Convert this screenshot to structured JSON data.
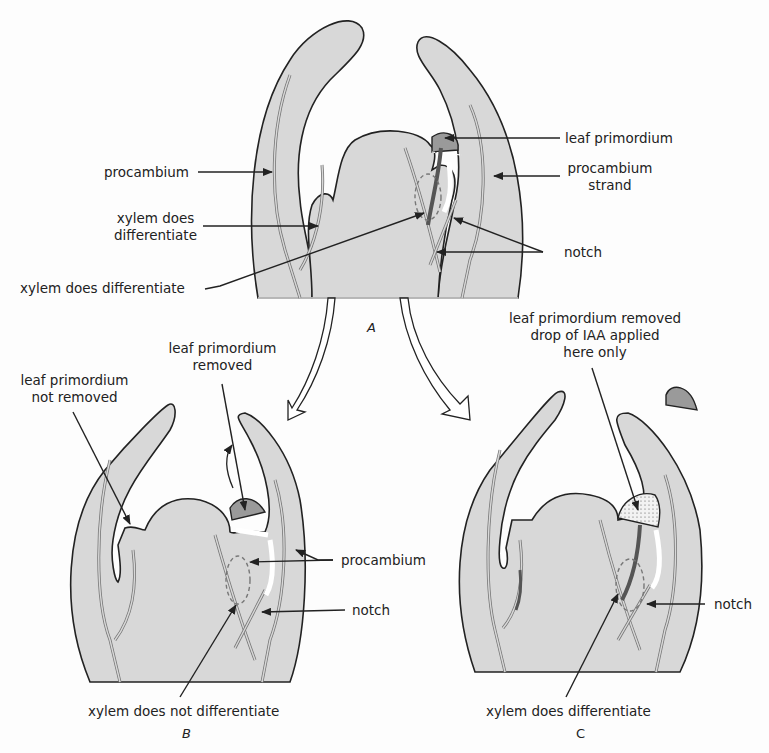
{
  "figure": {
    "panel_a": {
      "letter": "A",
      "labels": {
        "procambium": "procambium",
        "xylem_left_1": "xylem does",
        "xylem_left_2": "differentiate",
        "xylem_center": "xylem does differentiate",
        "leaf_primordium": "leaf primordium",
        "procambium_strand_1": "procambium",
        "procambium_strand_2": "strand",
        "notch": "notch"
      }
    },
    "panel_b": {
      "letter": "B",
      "labels": {
        "not_removed_1": "leaf primordium",
        "not_removed_2": "not removed",
        "removed_1": "leaf primordium",
        "removed_2": "removed",
        "procambium": "procambium",
        "notch": "notch",
        "xylem": "xylem does not differentiate"
      }
    },
    "panel_c": {
      "letter": "C",
      "labels": {
        "iaa_1": "leaf primordium removed",
        "iaa_2": "drop of IAA applied",
        "iaa_3": "here only",
        "notch": "notch",
        "xylem": "xylem does differentiate"
      }
    },
    "colors": {
      "tissue": "#d8d8d8",
      "primordium": "#9a9a9a",
      "outline": "#222222",
      "xylem": "#6e6e6e"
    }
  }
}
